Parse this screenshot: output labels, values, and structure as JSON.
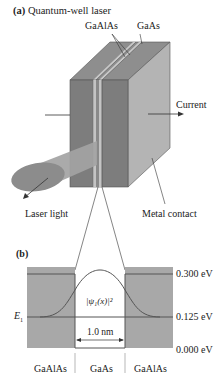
{
  "panel_a": {
    "title_tag": "(a)",
    "title": "Quantum-well laser",
    "labels": {
      "gaalas": "GaAlAs",
      "gaas": "GaAs",
      "current": "Current",
      "laser_light": "Laser light",
      "metal_contact": "Metal contact"
    }
  },
  "panel_b": {
    "title_tag": "(b)",
    "energy_levels": {
      "top": "0.300 eV",
      "e1": "0.125 eV",
      "bottom": "0.000 eV"
    },
    "e1_label": "E",
    "e1_sub": "1",
    "wavefunction_label": "|ψ₁(x)|²",
    "width_label": "1.0 nm",
    "regions": [
      "GaAlAs",
      "GaAs",
      "GaAlAs"
    ]
  },
  "colors": {
    "dark_gray": "#7d7d7d",
    "mid_gray": "#9a9a9a",
    "light_gray": "#b4b4b4",
    "band_fill": "#a8a8a8",
    "line": "#555555"
  }
}
